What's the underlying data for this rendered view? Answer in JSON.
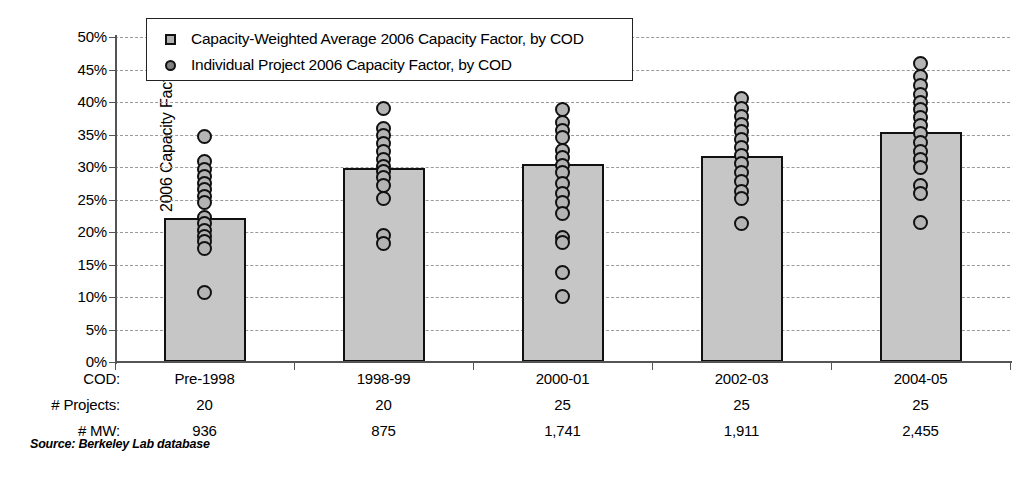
{
  "chart_data": {
    "type": "bar",
    "title": "",
    "xlabel": "COD",
    "ylabel": "2006 Capacity Factor",
    "ylim": [
      0,
      0.5
    ],
    "ytick_labels": [
      "50%",
      "45%",
      "40%",
      "35%",
      "30%",
      "25%",
      "20%",
      "15%",
      "10%",
      "5%",
      "0%"
    ],
    "ytick_values": [
      50,
      45,
      40,
      35,
      30,
      25,
      20,
      15,
      10,
      5,
      0
    ],
    "grid": true,
    "legend_position": "top-center",
    "legend": [
      {
        "symbol": "square",
        "label": "Capacity-Weighted Average 2006 Capacity Factor, by COD"
      },
      {
        "symbol": "circle",
        "label": "Individual Project 2006 Capacity Factor, by COD"
      }
    ],
    "categories": [
      "Pre-1998",
      "1998-99",
      "2000-01",
      "2002-03",
      "2004-05"
    ],
    "values": [
      22.2,
      29.9,
      30.5,
      31.7,
      35.4
    ],
    "series": [
      {
        "name": "Capacity-Weighted Average 2006 Capacity Factor, by COD",
        "values": [
          22.2,
          29.9,
          30.5,
          31.7,
          35.4
        ]
      },
      {
        "name": "Individual Project 2006 Capacity Factor, by COD",
        "points": [
          [
            34.7,
            30.8,
            29.6,
            28.6,
            27.4,
            26.5,
            25.5,
            24.6,
            22.3,
            21.3,
            20.3,
            19.3,
            18.5,
            17.4,
            10.7
          ],
          [
            39.0,
            36.0,
            34.8,
            33.6,
            32.4,
            31.1,
            30.1,
            29.3,
            28.4,
            27.2,
            25.2,
            19.4,
            18.2
          ],
          [
            38.8,
            36.8,
            35.6,
            34.5,
            32.6,
            31.5,
            30.2,
            29.1,
            27.4,
            25.9,
            24.5,
            22.8,
            19.2,
            18.4,
            13.8,
            10.1
          ],
          [
            40.5,
            39.0,
            37.8,
            36.6,
            35.4,
            34.2,
            33.0,
            31.8,
            30.5,
            29.2,
            27.8,
            26.3,
            25.1,
            21.3
          ],
          [
            45.9,
            44.0,
            42.6,
            41.2,
            40.0,
            38.8,
            37.6,
            36.4,
            35.1,
            33.8,
            32.4,
            31.1,
            29.9,
            27.2,
            25.9,
            21.5
          ]
        ]
      }
    ]
  },
  "table": {
    "row_labels": [
      "COD:",
      "# Projects:",
      "# MW:"
    ],
    "cod": [
      "Pre-1998",
      "1998-99",
      "2000-01",
      "2002-03",
      "2004-05"
    ],
    "projects": [
      "20",
      "20",
      "25",
      "25",
      "25"
    ],
    "mw": [
      "936",
      "875",
      "1,741",
      "1,911",
      "2,455"
    ]
  },
  "source": "Source: Berkeley Lab database",
  "colors": {
    "bar_fill": "#c6c6c6",
    "bar_edge": "#111111",
    "dot_fill": "#b4b4b4",
    "dot_edge": "#111111",
    "grid": "#9a9a9a",
    "axis": "#555555"
  }
}
